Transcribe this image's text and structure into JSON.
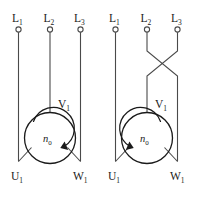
{
  "diagram": {
    "width": 197,
    "height": 198,
    "background_color": "#ffffff",
    "wire_color": "#4a4a4a",
    "ink_color": "#1a1a1a",
    "panels": [
      {
        "id": "left",
        "caption": "forward rotation",
        "phases_crossed": false,
        "rotation_direction": "clockwise",
        "supply_terminals": [
          {
            "name": "L1",
            "letter": "L",
            "subscript": "1"
          },
          {
            "name": "L2",
            "letter": "L",
            "subscript": "2"
          },
          {
            "name": "L3",
            "letter": "L",
            "subscript": "3"
          }
        ],
        "motor_terminals": [
          {
            "name": "U1",
            "letter": "U",
            "subscript": "1"
          },
          {
            "name": "V1",
            "letter": "V",
            "subscript": "1"
          },
          {
            "name": "W1",
            "letter": "W",
            "subscript": "1"
          }
        ],
        "speed_symbol": {
          "letter": "n",
          "subscript": "0"
        }
      },
      {
        "id": "right",
        "caption": "reverse rotation",
        "phases_crossed": true,
        "crossed_pair": [
          "L2",
          "L3"
        ],
        "rotation_direction": "counterclockwise",
        "supply_terminals": [
          {
            "name": "L1",
            "letter": "L",
            "subscript": "1"
          },
          {
            "name": "L2",
            "letter": "L",
            "subscript": "2"
          },
          {
            "name": "L3",
            "letter": "L",
            "subscript": "3"
          }
        ],
        "motor_terminals": [
          {
            "name": "U1",
            "letter": "U",
            "subscript": "1"
          },
          {
            "name": "V1",
            "letter": "V",
            "subscript": "1"
          },
          {
            "name": "W1",
            "letter": "W",
            "subscript": "1"
          }
        ],
        "speed_symbol": {
          "letter": "n",
          "subscript": "0"
        }
      }
    ]
  }
}
